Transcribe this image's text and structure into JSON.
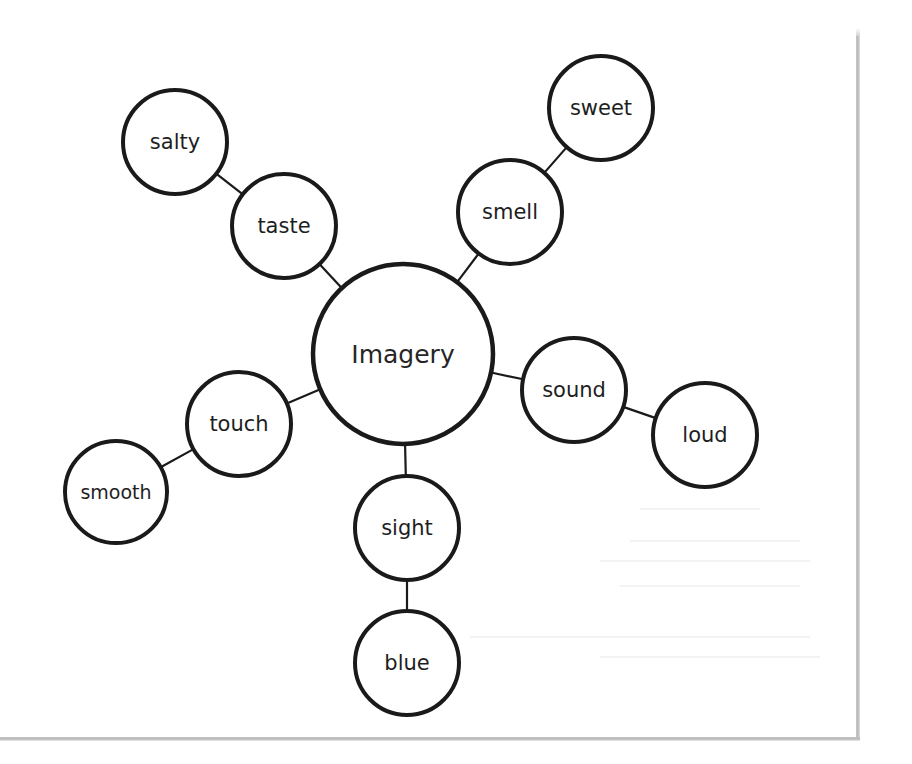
{
  "diagram": {
    "type": "concept-web",
    "center": {
      "label": "Imagery",
      "x": 403,
      "y": 354,
      "r": 90
    },
    "branches": [
      {
        "id": "taste",
        "sense": {
          "label": "taste",
          "x": 284,
          "y": 226,
          "r": 52
        },
        "example": {
          "label": "salty",
          "x": 175,
          "y": 142,
          "r": 52
        }
      },
      {
        "id": "smell",
        "sense": {
          "label": "smell",
          "x": 510,
          "y": 212,
          "r": 52
        },
        "example": {
          "label": "sweet",
          "x": 601,
          "y": 108,
          "r": 52
        }
      },
      {
        "id": "sound",
        "sense": {
          "label": "sound",
          "x": 574,
          "y": 390,
          "r": 52
        },
        "example": {
          "label": "loud",
          "x": 705,
          "y": 435,
          "r": 52
        }
      },
      {
        "id": "sight",
        "sense": {
          "label": "sight",
          "x": 407,
          "y": 528,
          "r": 52
        },
        "example": {
          "label": "blue",
          "x": 407,
          "y": 663,
          "r": 52
        }
      },
      {
        "id": "touch",
        "sense": {
          "label": "touch",
          "x": 239,
          "y": 424,
          "r": 52
        },
        "example": {
          "label": "smooth",
          "x": 116,
          "y": 492,
          "r": 51
        }
      }
    ],
    "colors": {
      "stroke": "#1a1a1a",
      "text": "#1e1e1e",
      "fill": "#ffffff",
      "background": "#ffffff",
      "page_edge": "#b8b8b8"
    }
  }
}
